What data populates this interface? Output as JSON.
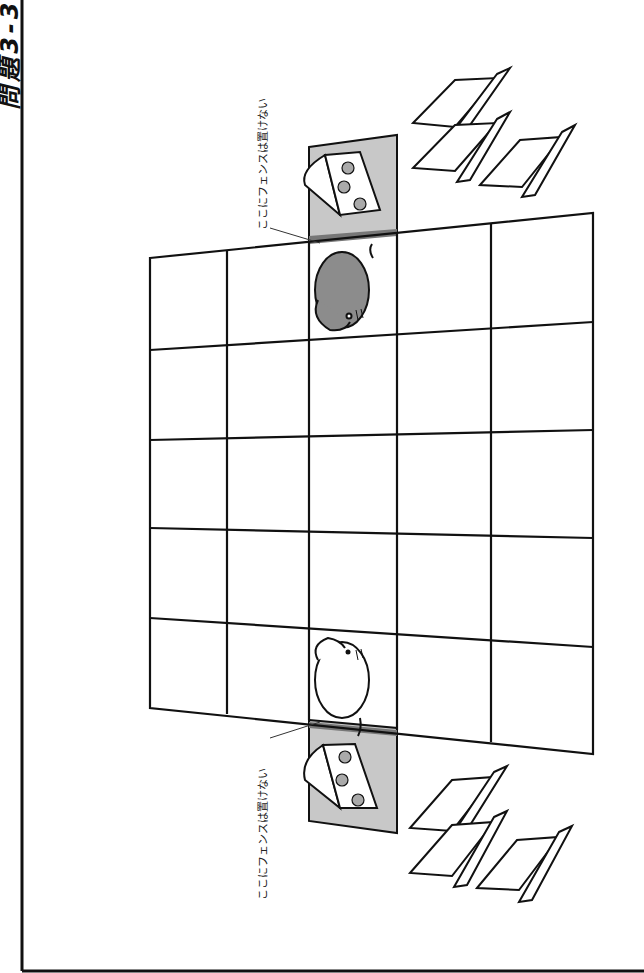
{
  "title": "問題3-3",
  "notes": {
    "top": "ここにフェンスは置けない",
    "bottom": "ここにフェンスは置けない"
  },
  "board": {
    "columns": 5,
    "rows": 5,
    "pieces": [
      {
        "type": "mouse",
        "color": "gray",
        "position": "top, center column"
      },
      {
        "type": "mouse",
        "color": "white",
        "position": "bottom, center column"
      },
      {
        "type": "cheese",
        "position": "above top edge, center column"
      },
      {
        "type": "cheese",
        "position": "below bottom edge, center column"
      }
    ],
    "fence_trays": {
      "top_count": 3,
      "bottom_count": 3
    }
  },
  "colors": {
    "line": "#111111",
    "shaded_square": "#c8c8c8",
    "gray_mouse": "#8c8c8c",
    "fence_strip": "#777777"
  }
}
